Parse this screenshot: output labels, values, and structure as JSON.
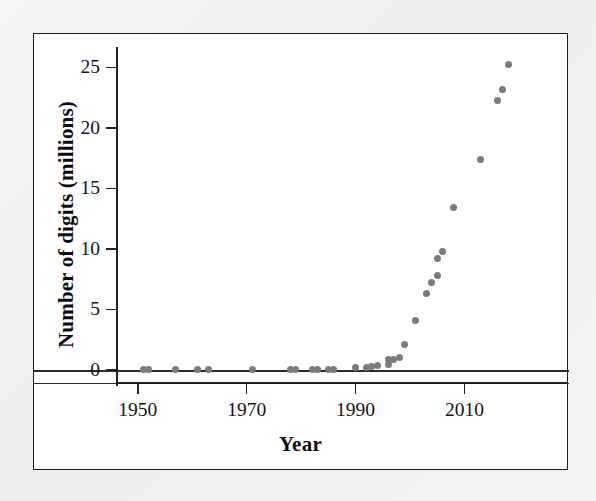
{
  "figure": {
    "background_color": "#ffffff",
    "page_color": "#f1f1f1",
    "frame_color": "#1b1b1b",
    "point_color": "#7b7b7b"
  },
  "chart_data": {
    "type": "scatter",
    "title": "",
    "xlabel": "Year",
    "ylabel": "Number of digits (millions)",
    "xlim": [
      1946,
      2029
    ],
    "ylim": [
      -0.6,
      26.8
    ],
    "grid": false,
    "legend": null,
    "xticks": [
      1950,
      1970,
      1990,
      2010
    ],
    "xtick_labels": [
      "1950",
      "1970",
      "1990",
      "2010"
    ],
    "yticks": [
      0,
      5,
      10,
      15,
      20,
      25
    ],
    "ytick_labels": [
      "0",
      "5",
      "10",
      "15",
      "20",
      "25"
    ],
    "marker": "circle",
    "marker_color": "#7b7b7b",
    "marker_size": 7,
    "points": [
      {
        "x": 1951,
        "y": 0.02
      },
      {
        "x": 1952,
        "y": 0.04
      },
      {
        "x": 1957,
        "y": 0.04
      },
      {
        "x": 1961,
        "y": 0.04
      },
      {
        "x": 1963,
        "y": 0.04
      },
      {
        "x": 1971,
        "y": 0.02
      },
      {
        "x": 1978,
        "y": 0.02
      },
      {
        "x": 1979,
        "y": 0.03
      },
      {
        "x": 1982,
        "y": 0.04
      },
      {
        "x": 1983,
        "y": 0.04
      },
      {
        "x": 1985,
        "y": 0.07
      },
      {
        "x": 1986,
        "y": 0.07
      },
      {
        "x": 1990,
        "y": 0.23
      },
      {
        "x": 1992,
        "y": 0.23
      },
      {
        "x": 1993,
        "y": 0.26
      },
      {
        "x": 1994,
        "y": 0.38
      },
      {
        "x": 1996,
        "y": 0.42
      },
      {
        "x": 1996,
        "y": 0.9
      },
      {
        "x": 1997,
        "y": 0.9
      },
      {
        "x": 1998,
        "y": 1.0
      },
      {
        "x": 1999,
        "y": 2.1
      },
      {
        "x": 2001,
        "y": 4.1
      },
      {
        "x": 2003,
        "y": 6.3
      },
      {
        "x": 2004,
        "y": 7.2
      },
      {
        "x": 2005,
        "y": 7.8
      },
      {
        "x": 2005,
        "y": 9.2
      },
      {
        "x": 2006,
        "y": 9.8
      },
      {
        "x": 2008,
        "y": 13.4
      },
      {
        "x": 2013,
        "y": 17.4
      },
      {
        "x": 2016,
        "y": 22.3
      },
      {
        "x": 2017,
        "y": 23.2
      },
      {
        "x": 2018,
        "y": 25.2
      }
    ]
  }
}
